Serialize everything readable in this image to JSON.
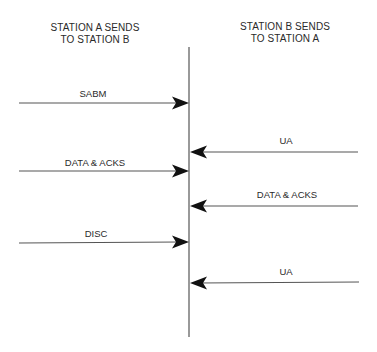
{
  "headers": {
    "station_a": {
      "line1": "STATION A SENDS",
      "line2": "TO STATION B"
    },
    "station_b": {
      "line1": "STATION B SENDS",
      "line2": "TO STATION A"
    }
  },
  "timeline": {
    "x": 189,
    "y_top": 47,
    "y_bottom": 337,
    "color": "#555555"
  },
  "messages": [
    {
      "label": "SABM",
      "direction": "A-to-B",
      "y": 103
    },
    {
      "label": "UA",
      "direction": "B-to-A",
      "y": 152
    },
    {
      "label": "DATA & ACKS",
      "direction": "A-to-B",
      "y": 171
    },
    {
      "label": "DATA & ACKS",
      "direction": "B-to-A",
      "y": 206
    },
    {
      "label": "DISC",
      "direction": "A-to-B",
      "y": 242
    },
    {
      "label": "UA",
      "direction": "B-to-A",
      "y": 283
    }
  ],
  "colors": {
    "line": "#555555",
    "arrowhead": "#111111",
    "text": "#2a2a2a"
  }
}
